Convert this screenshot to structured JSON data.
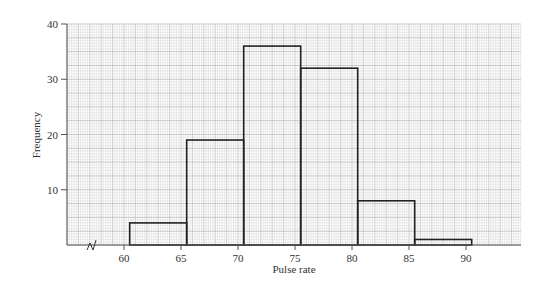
{
  "chart_data": {
    "type": "bar",
    "title": "",
    "xlabel": "Pulse rate",
    "ylabel": "Frequency",
    "bins": [
      {
        "from": 60.5,
        "to": 65.5,
        "value": 4
      },
      {
        "from": 65.5,
        "to": 70.5,
        "value": 19
      },
      {
        "from": 70.5,
        "to": 75.5,
        "value": 36
      },
      {
        "from": 75.5,
        "to": 80.5,
        "value": 32
      },
      {
        "from": 80.5,
        "to": 85.5,
        "value": 8
      },
      {
        "from": 85.5,
        "to": 90.5,
        "value": 1
      }
    ],
    "categories": [
      "60.5-65.5",
      "65.5-70.5",
      "70.5-75.5",
      "75.5-80.5",
      "80.5-85.5",
      "85.5-90.5"
    ],
    "values": [
      4,
      19,
      36,
      32,
      8,
      1
    ],
    "x_ticks": [
      60,
      65,
      70,
      75,
      80,
      85,
      90
    ],
    "y_ticks": [
      10,
      20,
      30,
      40
    ],
    "ylim": [
      0,
      40
    ],
    "xlim": [
      55,
      95
    ],
    "grid": true,
    "axis_break": true
  }
}
